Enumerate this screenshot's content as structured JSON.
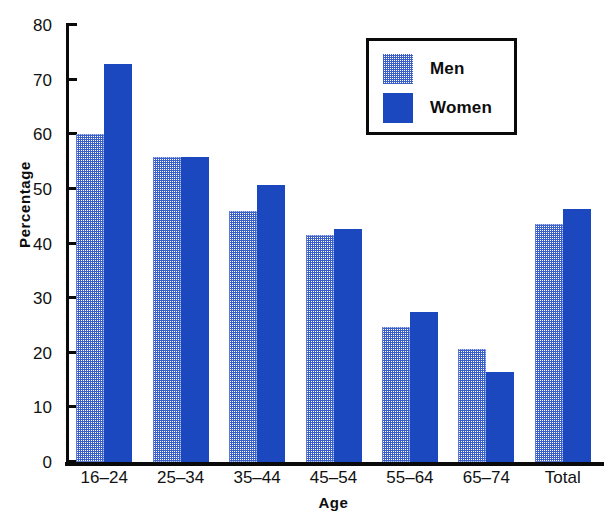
{
  "chart_data": {
    "type": "bar",
    "title": "",
    "xlabel": "Age",
    "ylabel": "Percentage",
    "categories": [
      "16–24",
      "25–34",
      "35–44",
      "45–54",
      "55–64",
      "65–74",
      "Total"
    ],
    "series": [
      {
        "name": "Men",
        "color": "#3a5fc8",
        "fill": "checkerboard-dither",
        "values": [
          60.0,
          55.8,
          46.0,
          41.6,
          24.8,
          20.6,
          43.5
        ]
      },
      {
        "name": "Women",
        "color": "#1b48be",
        "fill": "solid",
        "values": [
          72.9,
          55.8,
          50.8,
          42.6,
          27.4,
          16.5,
          46.4
        ]
      }
    ],
    "ylim": [
      0,
      80
    ],
    "ytick_labels": [
      "0",
      "10",
      "20",
      "30",
      "40",
      "50",
      "60",
      "70",
      "80"
    ],
    "ytick_values": [
      0,
      10,
      20,
      30,
      40,
      50,
      60,
      70,
      80
    ],
    "grid": false,
    "legend_position": "top-right",
    "legend_entries": [
      "Men",
      "Women"
    ]
  },
  "axes": {
    "x_axis_title": "Age",
    "y_axis_title": "Percentage"
  },
  "legend": {
    "men_label": "Men",
    "women_label": "Women"
  },
  "colors": {
    "men": "#3a5fc8",
    "women": "#1b48be",
    "axis": "#0a0a0a",
    "background": "#ffffff"
  }
}
